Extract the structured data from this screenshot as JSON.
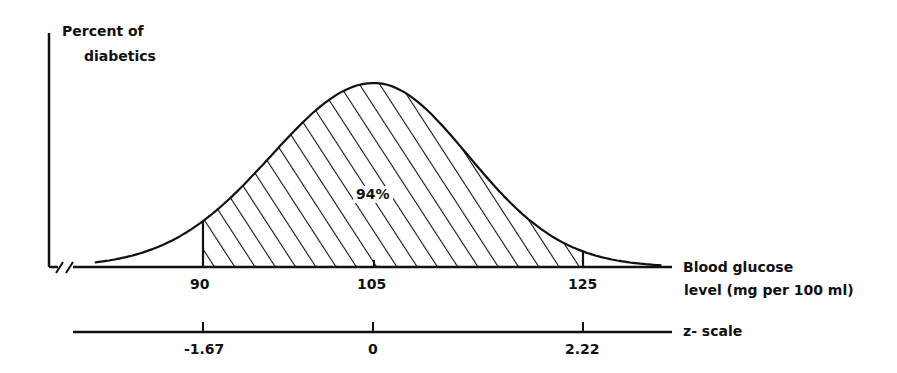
{
  "chart_data": {
    "type": "area",
    "title": "",
    "ylabel": "Percent of diabetics",
    "xlabel": "Blood glucose level (mg per 100 ml)",
    "xlabel_lines": [
      "Blood glucose",
      "level (mg per 100 ml)"
    ],
    "secondary_axis_label": "z-scale",
    "distribution": "normal",
    "mean": 105,
    "sd": 9,
    "x_ticks": [
      90,
      105,
      125
    ],
    "x_tick_labels": [
      "90",
      "105",
      "125"
    ],
    "z_ticks": [
      -1.67,
      0,
      2.22
    ],
    "z_tick_labels": [
      "-1.67",
      "0",
      "2.22"
    ],
    "shaded_region": {
      "from": 90,
      "to": 125,
      "label": "94%",
      "pattern": "diagonal-hatch"
    },
    "axis_break": true,
    "grid": false,
    "legend": null
  },
  "labels": {
    "ylabel_line1": "Percent of",
    "ylabel_line2": "diabetics",
    "xlabel_line1": "Blood glucose",
    "xlabel_line2": "level (mg per 100 ml)",
    "zlabel": "z- scale",
    "area_label": "94%",
    "tick_90": "90",
    "tick_105": "105",
    "tick_125": "125",
    "z_neg": "-1.67",
    "z_zero": "0",
    "z_pos": "2.22"
  }
}
